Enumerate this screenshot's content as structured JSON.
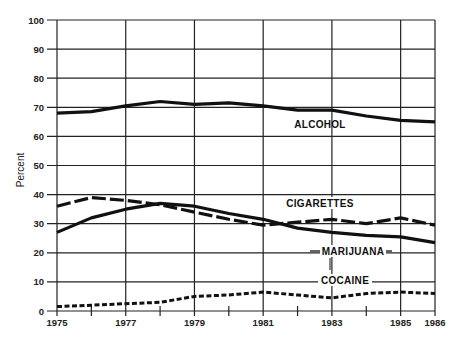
{
  "chart_data": {
    "type": "line",
    "title": "",
    "xlabel": "",
    "ylabel": "Percent",
    "ylim": [
      0,
      100
    ],
    "xlim": [
      1975,
      1986
    ],
    "grid": true,
    "legend_position": "inline labels",
    "y_ticks": [
      0,
      10,
      20,
      30,
      40,
      50,
      60,
      70,
      80,
      90,
      100
    ],
    "x_tick_labels": [
      "1975",
      "1977",
      "1979",
      "1981",
      "1983",
      "1985",
      "1986"
    ],
    "x": [
      1975,
      1976,
      1977,
      1978,
      1979,
      1980,
      1981,
      1982,
      1983,
      1984,
      1985,
      1986
    ],
    "series": [
      {
        "name": "ALCOHOL",
        "style": "solid",
        "values": [
          68,
          68.5,
          70.5,
          72,
          71,
          71.5,
          70.5,
          69,
          69,
          67,
          65.5,
          65
        ]
      },
      {
        "name": "CIGARETTES",
        "style": "long-dash",
        "values": [
          36,
          39,
          38,
          36.5,
          34,
          31.5,
          29.5,
          30.5,
          31.5,
          30,
          32,
          29.5
        ]
      },
      {
        "name": "MARIJUANA",
        "style": "solid",
        "values": [
          27,
          32,
          35,
          37,
          36,
          33.5,
          31.5,
          28.5,
          27,
          26,
          25.5,
          23.5
        ]
      },
      {
        "name": "COCAINE",
        "style": "short-dash",
        "values": [
          1.5,
          2,
          2.5,
          3,
          5,
          5.5,
          6.5,
          5.5,
          4.5,
          6,
          6.5,
          6
        ]
      }
    ]
  },
  "labels": {
    "ylabel": "Percent",
    "alcohol": "ALCOHOL",
    "cigarettes": "CIGARETTES",
    "marijuana": "MARIJUANA",
    "cocaine": "COCAINE"
  },
  "colors": {
    "line": "#111111",
    "grid": "#222222",
    "background": "#ffffff"
  }
}
